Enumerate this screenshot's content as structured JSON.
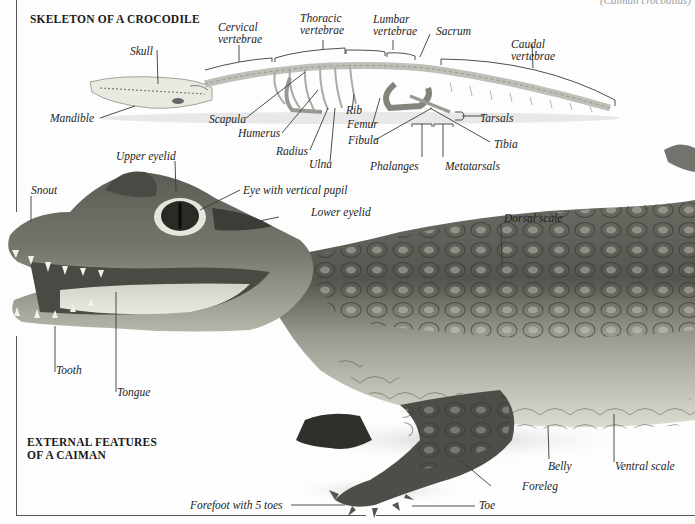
{
  "page": {
    "top_caption_partial": "(Caiman crocodilus)",
    "background": "#fdfdfd",
    "frame_color": "#555555"
  },
  "skeleton": {
    "title": "SKELETON OF A CROCODILE",
    "labels": {
      "skull": "Skull",
      "mandible": "Mandible",
      "cervical": "Cervical vertebrae",
      "cervical_l1": "Cervical",
      "cervical_l2": "vertebrae",
      "thoracic_l1": "Thoracic",
      "thoracic_l2": "vertebrae",
      "lumbar_l1": "Lumbar",
      "lumbar_l2": "vertebrae",
      "sacrum": "Sacrum",
      "caudal_l1": "Caudal",
      "caudal_l2": "vertebrae",
      "scapula": "Scapula",
      "humerus": "Humerus",
      "radius": "Radius",
      "ulna": "Ulna",
      "rib": "Rib",
      "femur": "Femur",
      "fibula": "Fibula",
      "tarsals": "Tarsals",
      "tibia": "Tibia",
      "phalanges": "Phalanges",
      "metatarsals": "Metatarsals"
    }
  },
  "caiman": {
    "title_l1": "EXTERNAL FEATURES",
    "title_l2": "OF A CAIMAN",
    "labels": {
      "upper_eyelid": "Upper eyelid",
      "snout": "Snout",
      "eye": "Eye with vertical pupil",
      "lower_eyelid": "Lower eyelid",
      "dorsal_scale": "Dorsal scale",
      "tooth": "Tooth",
      "tongue": "Tongue",
      "belly": "Belly",
      "ventral_scale": "Ventral scale",
      "foreleg": "Foreleg",
      "forefoot": "Forefoot with 5 toes",
      "toe": "Toe"
    },
    "colors": {
      "skin_dark": "#3a3a36",
      "skin_mid": "#7a7a70",
      "skin_light": "#c9c9bd",
      "belly": "#e2e2d8",
      "bone": "#d8d8d0"
    }
  }
}
